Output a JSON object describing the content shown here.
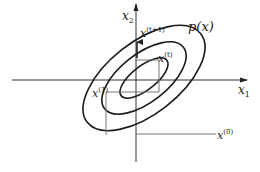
{
  "diagram": {
    "axes": {
      "x1": {
        "label": "x",
        "subscript": "1"
      },
      "x2": {
        "label": "x",
        "subscript": "2"
      }
    },
    "distribution_label": "p(x)",
    "points": {
      "x0": {
        "label": "x",
        "superscript": "(0)"
      },
      "x1": {
        "label": "x",
        "superscript": "(1)"
      },
      "xt": {
        "label": "x",
        "superscript": "(t)"
      },
      "xt1": {
        "label": "x",
        "superscript": "(t+1)"
      }
    },
    "contours": 3,
    "colors": {
      "curve": "#1a1a1a",
      "axis": "#333333",
      "guide": "#777777"
    }
  }
}
